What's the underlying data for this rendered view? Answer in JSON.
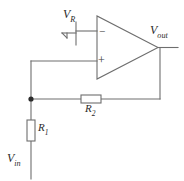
{
  "diagram": {
    "background_color": "#ffffff",
    "line_color": "#6e6e6e",
    "text_color": "#2b2b2b"
  },
  "labels": {
    "vr": {
      "base": "V",
      "sub": "R"
    },
    "vout": {
      "base": "V",
      "sub": "out"
    },
    "vin": {
      "base": "V",
      "sub": "in"
    },
    "r1": {
      "base": "R",
      "sub": "1"
    },
    "r2": {
      "base": "R",
      "sub": "2"
    }
  },
  "opamp": {
    "inverting_sign": "−",
    "noninverting_sign": "+"
  },
  "components": [
    {
      "name": "opamp",
      "type": "operational-amplifier"
    },
    {
      "name": "resistor-r1",
      "type": "resistor",
      "label": "R1",
      "orientation": "vertical"
    },
    {
      "name": "resistor-r2",
      "type": "resistor",
      "label": "R2",
      "orientation": "horizontal"
    },
    {
      "name": "ground",
      "type": "ground-symbol"
    },
    {
      "name": "junction-node",
      "type": "node-dot"
    }
  ],
  "nets": [
    {
      "name": "vr-to-inverting-input",
      "from": "V_R / ground",
      "to": "opamp inverting input"
    },
    {
      "name": "node-to-noninverting-input",
      "from": "junction node",
      "to": "opamp non-inverting input"
    },
    {
      "name": "output-feedback",
      "from": "V_out",
      "to": "junction node via R2"
    },
    {
      "name": "input-branch",
      "from": "V_in",
      "to": "junction node via R1"
    }
  ]
}
